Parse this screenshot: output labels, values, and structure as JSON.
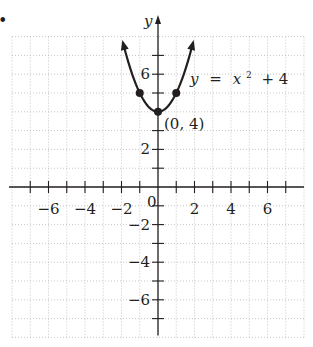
{
  "bullet": "•",
  "chart_data": {
    "type": "line",
    "title": "",
    "function": "y = x^2 + 4",
    "xlabel": "",
    "ylabel": "y",
    "xlim": [
      -8,
      8
    ],
    "ylim": [
      -8,
      8
    ],
    "grid": true,
    "x_ticks": [
      -7,
      -6,
      -5,
      -4,
      -3,
      -2,
      -1,
      1,
      2,
      3,
      4,
      5,
      6,
      7
    ],
    "x_tick_labels": [
      {
        "value": -6,
        "label": "−6"
      },
      {
        "value": -4,
        "label": "−4"
      },
      {
        "value": -2,
        "label": "−2"
      },
      {
        "value": 2,
        "label": "2"
      },
      {
        "value": 4,
        "label": "4"
      },
      {
        "value": 6,
        "label": "6"
      }
    ],
    "y_ticks": [
      -7,
      -6,
      -5,
      -4,
      -3,
      -2,
      -1,
      1,
      2,
      3,
      5,
      6,
      7
    ],
    "y_tick_labels": [
      {
        "value": 6,
        "label": "6"
      },
      {
        "value": 2,
        "label": "2"
      },
      {
        "value": -2,
        "label": "−2"
      },
      {
        "value": -4,
        "label": "−4"
      },
      {
        "value": -6,
        "label": "−6"
      }
    ],
    "origin_label": "0",
    "series": [
      {
        "name": "y = x² + 4",
        "x_range": [
          -1.9,
          1.9
        ],
        "arrows": "both-ends",
        "points": [
          {
            "x": -1,
            "y": 5
          },
          {
            "x": 0,
            "y": 4
          },
          {
            "x": 1,
            "y": 5
          }
        ]
      }
    ],
    "annotations": [
      {
        "text": "y = x² + 4",
        "x": 1.8,
        "y": 5.6
      },
      {
        "text": "(0, 4)",
        "x": 0.4,
        "y": 3.1
      }
    ]
  },
  "labels": {
    "y_axis": "y",
    "origin": "0",
    "equation_y": "y",
    "equation_eq": "=",
    "equation_x": "x",
    "equation_exp": "2",
    "equation_rest": "+ 4",
    "vertex": "(0, 4)"
  }
}
